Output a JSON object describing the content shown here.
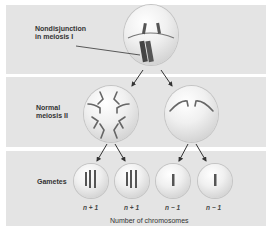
{
  "diagram": {
    "title": "Nondisjunction in meiosis I",
    "rows": [
      {
        "label": "Nondisjunction\nin meiosis I"
      },
      {
        "label": "Normal\nmeiosis II"
      },
      {
        "label": "Gametes"
      }
    ],
    "gametes": [
      {
        "count_label": "n + 1",
        "chromosomes": 3
      },
      {
        "count_label": "n + 1",
        "chromosomes": 3
      },
      {
        "count_label": "n − 1",
        "chromosomes": 1
      },
      {
        "count_label": "n − 1",
        "chromosomes": 1
      }
    ],
    "caption": "Number of chromosomes"
  }
}
